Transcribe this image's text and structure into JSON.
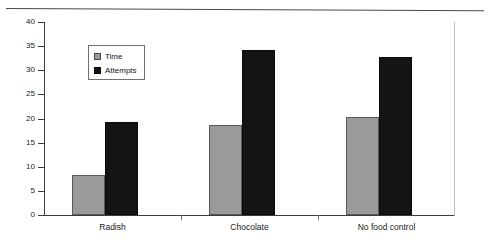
{
  "chart_data": {
    "type": "bar",
    "title": "",
    "subtitle": "",
    "xlabel": "",
    "ylabel": "",
    "categories": [
      "Radish",
      "Chocolate",
      "No food control"
    ],
    "series": [
      {
        "name": "Time",
        "color": "#9a9a9a",
        "values": [
          8.3,
          18.6,
          20.3
        ]
      },
      {
        "name": "Attempts",
        "color": "#141414",
        "values": [
          19.3,
          34.2,
          32.7
        ]
      }
    ],
    "ylim": [
      0,
      40
    ],
    "yticks": [
      0,
      5,
      10,
      15,
      20,
      25,
      30,
      35,
      40
    ],
    "ytick_labels": [
      "0",
      "5",
      "10",
      "15",
      "20",
      "25",
      "30",
      "35",
      "40"
    ],
    "grid": false,
    "legend_position": "upper-left-inside",
    "legend_entries": [
      "Time",
      "Attempts"
    ]
  },
  "figure": {
    "background_color": "#ffffff",
    "axis_color": "#3d3d3d",
    "top_rule": "horizontal-rule"
  }
}
